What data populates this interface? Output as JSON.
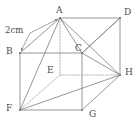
{
  "figure": {
    "type": "geometry-diagram",
    "shape": "cuboid",
    "title": "",
    "stroke_color": "#8a8a8a",
    "hidden_stroke_color": "#a8a8a8",
    "label_color": "#4a4a4a",
    "background": "#ffffff",
    "annotation": {
      "text": "2cm",
      "measures_edge": "AB",
      "x": 5,
      "y": 26
    },
    "vertices": [
      {
        "id": "A",
        "label": "A",
        "x": 60,
        "y": 18,
        "hidden": false,
        "label_x": 56,
        "label_y": 6
      },
      {
        "id": "B",
        "label": "B",
        "x": 20,
        "y": 53,
        "hidden": false,
        "label_x": 6,
        "label_y": 47
      },
      {
        "id": "C",
        "label": "C",
        "x": 82,
        "y": 53,
        "hidden": false,
        "label_x": 75,
        "label_y": 44
      },
      {
        "id": "D",
        "label": "D",
        "x": 120,
        "y": 18,
        "hidden": false,
        "label_x": 124,
        "label_y": 8
      },
      {
        "id": "E",
        "label": "E",
        "x": 60,
        "y": 75,
        "hidden": true,
        "label_x": 47,
        "label_y": 66
      },
      {
        "id": "F",
        "label": "F",
        "x": 20,
        "y": 110,
        "hidden": false,
        "label_x": 6,
        "label_y": 104
      },
      {
        "id": "G",
        "label": "G",
        "x": 82,
        "y": 110,
        "hidden": false,
        "label_x": 89,
        "label_y": 110
      },
      {
        "id": "H",
        "label": "H",
        "x": 120,
        "y": 75,
        "hidden": false,
        "label_x": 125,
        "label_y": 68
      }
    ],
    "edges": [
      {
        "from": "A",
        "to": "D",
        "style": "solid"
      },
      {
        "from": "A",
        "to": "B",
        "style": "solid"
      },
      {
        "from": "B",
        "to": "C",
        "style": "solid"
      },
      {
        "from": "C",
        "to": "D",
        "style": "solid"
      },
      {
        "from": "B",
        "to": "F",
        "style": "solid"
      },
      {
        "from": "C",
        "to": "G",
        "style": "solid"
      },
      {
        "from": "D",
        "to": "H",
        "style": "solid"
      },
      {
        "from": "F",
        "to": "G",
        "style": "solid"
      },
      {
        "from": "G",
        "to": "H",
        "style": "solid"
      },
      {
        "from": "A",
        "to": "E",
        "style": "dotted"
      },
      {
        "from": "E",
        "to": "F",
        "style": "dotted"
      },
      {
        "from": "E",
        "to": "H",
        "style": "dotted"
      }
    ],
    "diagonals": [
      {
        "from": "A",
        "to": "C",
        "style": "solid"
      },
      {
        "from": "A",
        "to": "F",
        "style": "solid"
      },
      {
        "from": "A",
        "to": "H",
        "style": "solid"
      },
      {
        "from": "F",
        "to": "H",
        "style": "solid"
      },
      {
        "from": "C",
        "to": "H",
        "style": "solid"
      },
      {
        "from": "D",
        "to": "C",
        "style": "solid"
      }
    ],
    "leader_lines": [
      {
        "from_x": 30,
        "from_y": 33,
        "to_x": 58,
        "to_y": 19,
        "arrow": true
      },
      {
        "from_x": 30,
        "from_y": 33,
        "to_x": 21,
        "to_y": 51,
        "arrow": true
      }
    ]
  }
}
